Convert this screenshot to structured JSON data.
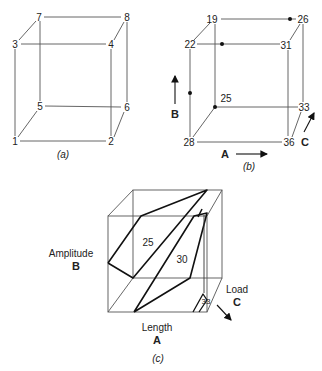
{
  "panel_a": {
    "caption": "(a)",
    "vertex_labels": {
      "v1": "1",
      "v2": "2",
      "v3": "3",
      "v4": "4",
      "v5": "5",
      "v6": "6",
      "v7": "7",
      "v8": "8"
    }
  },
  "panel_b": {
    "caption": "(b)",
    "vertex_values": {
      "front_bottom_left": "28",
      "front_bottom_right": "36",
      "front_top_left": "22",
      "front_top_right": "31",
      "back_bottom_left": "25",
      "back_bottom_right": "33",
      "back_top_left": "19",
      "back_top_right": "26"
    },
    "axes": {
      "a_label": "A",
      "b_label": "B",
      "c_label": "C"
    }
  },
  "panel_c": {
    "caption": "(c)",
    "contour_labels": [
      "25",
      "30",
      "33"
    ],
    "axes": {
      "a_name": "Length",
      "a_letter": "A",
      "b_name": "Amplitude",
      "b_letter": "B",
      "c_name": "Load",
      "c_letter": "C"
    }
  }
}
